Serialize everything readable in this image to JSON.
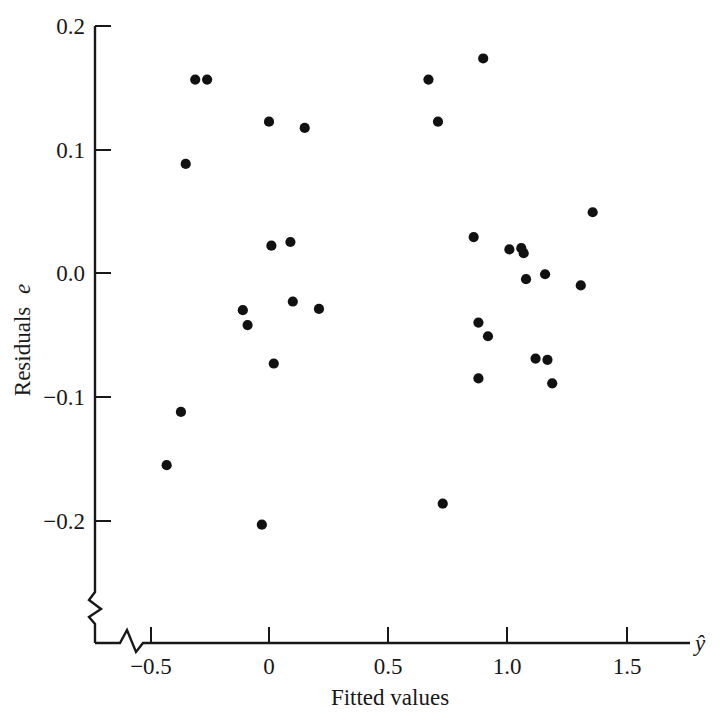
{
  "chart_data": {
    "type": "scatter",
    "title": "",
    "subtitle": "",
    "xlabel": "Fitted values",
    "xaxis_symbol": "ŷ",
    "ylabel": "Residuals e",
    "ylabel_text": "Residuals",
    "ylabel_symbol": "e",
    "xlim": [
      -0.62,
      1.72
    ],
    "ylim": [
      -0.235,
      0.205
    ],
    "grid": false,
    "legend": null,
    "axis_break_x": true,
    "axis_break_y": true,
    "xticks": [
      -0.5,
      0,
      0.5,
      1.0,
      1.5
    ],
    "xticklabels": [
      "−0.5",
      "0",
      "0.5",
      "1.0",
      "1.5"
    ],
    "yticks": [
      -0.2,
      -0.1,
      0.0,
      0.1,
      0.2
    ],
    "yticklabels": [
      "−0.2",
      "−0.1",
      "0.0",
      "0.1",
      "0.2"
    ],
    "marker": "filled-circle",
    "marker_color": "#111111",
    "marker_size": 6,
    "n_points": 33,
    "points": [
      {
        "x": -0.43,
        "y": -0.155
      },
      {
        "x": -0.37,
        "y": -0.112
      },
      {
        "x": -0.35,
        "y": 0.088
      },
      {
        "x": -0.31,
        "y": 0.156
      },
      {
        "x": -0.26,
        "y": 0.156
      },
      {
        "x": -0.11,
        "y": -0.03
      },
      {
        "x": -0.09,
        "y": -0.042
      },
      {
        "x": -0.03,
        "y": -0.203
      },
      {
        "x": 0.0,
        "y": 0.122
      },
      {
        "x": 0.01,
        "y": 0.022
      },
      {
        "x": 0.02,
        "y": -0.073
      },
      {
        "x": 0.09,
        "y": 0.025
      },
      {
        "x": 0.1,
        "y": -0.023
      },
      {
        "x": 0.15,
        "y": 0.117
      },
      {
        "x": 0.21,
        "y": -0.029
      },
      {
        "x": 0.67,
        "y": 0.156
      },
      {
        "x": 0.71,
        "y": 0.122
      },
      {
        "x": 0.73,
        "y": -0.186
      },
      {
        "x": 0.86,
        "y": 0.029
      },
      {
        "x": 0.88,
        "y": -0.04
      },
      {
        "x": 0.88,
        "y": -0.085
      },
      {
        "x": 0.9,
        "y": 0.173
      },
      {
        "x": 0.92,
        "y": -0.051
      },
      {
        "x": 1.01,
        "y": 0.019
      },
      {
        "x": 1.06,
        "y": 0.02
      },
      {
        "x": 1.07,
        "y": 0.016
      },
      {
        "x": 1.08,
        "y": -0.005
      },
      {
        "x": 1.16,
        "y": -0.001
      },
      {
        "x": 1.17,
        "y": -0.07
      },
      {
        "x": 1.19,
        "y": -0.089
      },
      {
        "x": 1.31,
        "y": -0.01
      },
      {
        "x": 1.36,
        "y": 0.049
      },
      {
        "x": 1.12,
        "y": -0.069
      }
    ]
  }
}
